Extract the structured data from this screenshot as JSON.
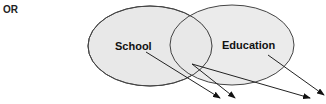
{
  "heading": "OR",
  "diagram": {
    "sets": [
      {
        "label": "School",
        "cx": 150,
        "cy": 46,
        "rx": 62,
        "ry": 40
      },
      {
        "label": "Education",
        "cx": 232,
        "cy": 45,
        "rx": 62,
        "ry": 40
      }
    ],
    "fill": "#e8e8e8",
    "stroke": "#444444",
    "arrows": [
      {
        "from": "School",
        "x1": 146,
        "y1": 52,
        "x2": 220,
        "y2": 98
      },
      {
        "from": "Intersection",
        "x1": 192,
        "y1": 64,
        "x2": 235,
        "y2": 98
      },
      {
        "from": "Intersection",
        "x1": 192,
        "y1": 64,
        "x2": 310,
        "y2": 98
      },
      {
        "from": "Education",
        "x1": 268,
        "y1": 55,
        "x2": 324,
        "y2": 95
      }
    ]
  }
}
